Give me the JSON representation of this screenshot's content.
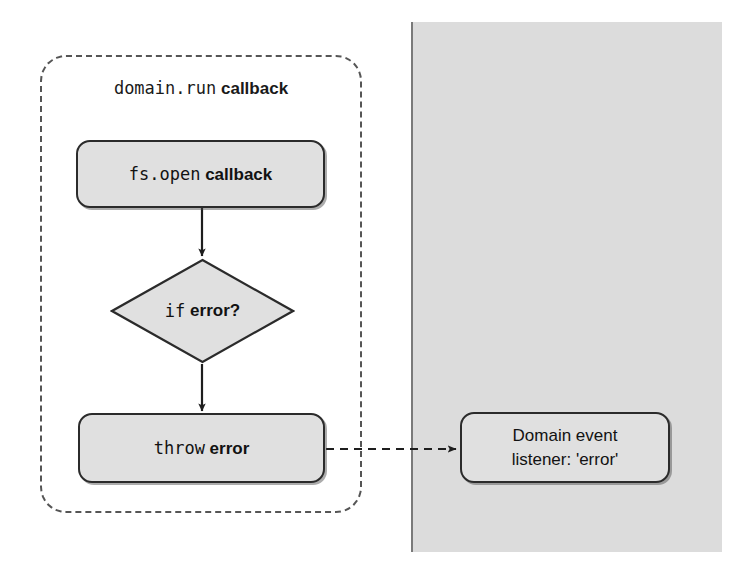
{
  "diagram": {
    "colors": {
      "panel_gray": "#dcdcdc",
      "node_fill": "#e0e0e0",
      "stroke": "#2b2b2b",
      "dashed_stroke": "#555555",
      "background": "#ffffff"
    },
    "region": {
      "label_mono": "domain.run",
      "label_sans": "callback",
      "style": "dashed-rounded-rectangle"
    },
    "panel": {
      "name": "domain-context-panel",
      "fill": "#dcdcdc"
    },
    "nodes": [
      {
        "id": "fs-open-callback",
        "shape": "rounded-rectangle",
        "text_mono": "fs.open",
        "text_sans": "callback"
      },
      {
        "id": "if-error",
        "shape": "diamond",
        "text_mono": "if",
        "text_sans": "error?"
      },
      {
        "id": "throw-error",
        "shape": "rounded-rectangle",
        "text_mono": "throw",
        "text_sans": "error"
      },
      {
        "id": "domain-event-listener",
        "shape": "rounded-rectangle",
        "line1": "Domain event",
        "line2": "listener: 'error'"
      }
    ],
    "edges": [
      {
        "id": "fs-open-to-if-error",
        "from": "fs-open-callback",
        "to": "if-error",
        "style": "solid",
        "arrowhead": true,
        "label": ""
      },
      {
        "id": "if-error-to-throw-error",
        "from": "if-error",
        "to": "throw-error",
        "style": "solid",
        "arrowhead": true,
        "label": ""
      },
      {
        "id": "throw-error-to-domain-listener",
        "from": "throw-error",
        "to": "domain-event-listener",
        "style": "dashed",
        "arrowhead": true,
        "label": ""
      }
    ]
  }
}
